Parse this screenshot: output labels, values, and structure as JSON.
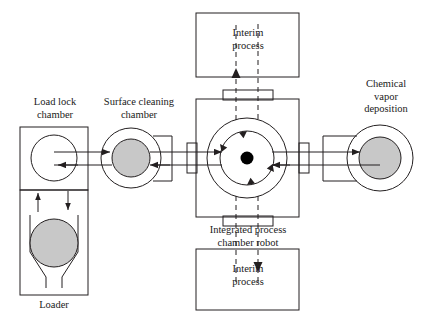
{
  "figure": {
    "background_color": "#ffffff",
    "line_color": "#231f20",
    "wafer_fill_color": "#c8c8c8",
    "hub_dot_color": "#000000"
  },
  "labels": {
    "load_lock_chamber": "Load lock\nchamber",
    "surface_cleaning_chamber": "Surface cleaning\nchamber",
    "chemical_vapor_deposition": "Chemical\nvapor\ndeposition",
    "interim_process_top": "Interim\nprocess",
    "interim_process_bottom": "Interim\nprocess",
    "integrated_process_chamber_robot": "Integrated process\nchamber robot",
    "loader": "Loader"
  },
  "stations": [
    {
      "id": "load-lock-chamber",
      "name": "Load lock chamber",
      "shape": "rectangle-with-open-circle",
      "wafer_filled": false
    },
    {
      "id": "loader",
      "name": "Loader",
      "shape": "rectangle-with-funnel-and-wafer",
      "wafer_filled": true
    },
    {
      "id": "surface-cleaning-chamber",
      "name": "Surface cleaning chamber",
      "shape": "circle-with-wafer",
      "wafer_filled": true
    },
    {
      "id": "integrated-process-chamber-robot",
      "name": "Integrated process chamber robot",
      "shape": "rectangle-with-concentric-circles",
      "rotation": "clockwise",
      "arrow_count": 4
    },
    {
      "id": "chemical-vapor-deposition",
      "name": "Chemical vapor deposition",
      "shape": "circle-with-wafer",
      "wafer_filled": true
    },
    {
      "id": "interim-process-top",
      "name": "Interim process top",
      "shape": "rectangle"
    },
    {
      "id": "interim-process-bottom",
      "name": "Interim process bottom",
      "shape": "rectangle"
    }
  ],
  "flows": [
    {
      "id": "transfer-out-path",
      "style": "solid",
      "direction": "rightward",
      "description": "Upper horizontal transfer line carrying wafers toward deposition"
    },
    {
      "id": "transfer-return-path",
      "style": "solid",
      "direction": "leftward",
      "description": "Lower horizontal transfer line returning wafers to load lock"
    },
    {
      "id": "interim-up-path",
      "style": "dashed",
      "direction": "upward",
      "description": "Dashed route from robot hub up to top interim process"
    },
    {
      "id": "interim-down-path",
      "style": "dashed",
      "direction": "downward",
      "description": "Dashed route from robot hub down to bottom interim process"
    },
    {
      "id": "loader-up-path",
      "style": "solid",
      "direction": "upward",
      "description": "Loader to load lock chamber"
    },
    {
      "id": "loader-down-path",
      "style": "solid",
      "direction": "downward",
      "description": "Load lock chamber back to loader"
    }
  ]
}
